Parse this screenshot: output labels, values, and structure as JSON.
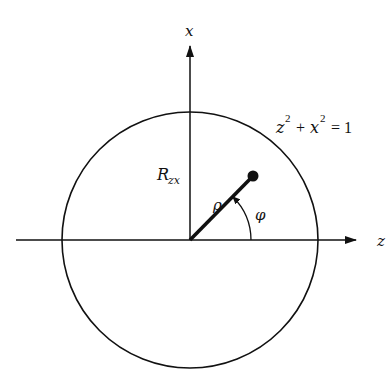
{
  "diagram": {
    "axes": {
      "vertical_label": "x",
      "horizontal_label": "z"
    },
    "circle": {
      "equation_lhs_var1": "z",
      "equation_exp1": "2",
      "equation_plus": "+",
      "equation_lhs_var2": "x",
      "equation_exp2": "2",
      "equation_rhs": "= 1"
    },
    "radius_label": "R",
    "radius_subscript": "zx",
    "vector_label": "ρ",
    "angle_label": "φ",
    "colors": {
      "ink": "#111111",
      "background": "#ffffff"
    }
  }
}
